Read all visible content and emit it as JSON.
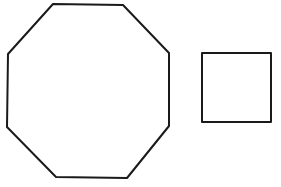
{
  "diagram": {
    "title": "",
    "shapes": [
      {
        "id": "octagon",
        "type": "octagon",
        "points": "53,4 123,5 169,53 169,126 127,178 56,177 7,127 8,54",
        "stroke": "#1a1a1a",
        "fill": "none"
      },
      {
        "id": "square",
        "type": "square",
        "points": "202,53 271,53 271,122 202,122",
        "stroke": "#1a1a1a",
        "fill": "none"
      }
    ]
  }
}
